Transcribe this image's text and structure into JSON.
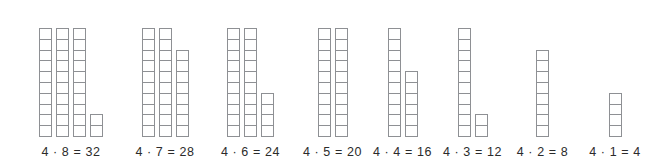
{
  "figure": {
    "units_per_full_column": 10,
    "grid_line_color": "#8e9094",
    "cell_fill_color": "#ffffff",
    "background_color": "#ffffff",
    "label_color": "#2b2b2b"
  },
  "chart_data": {
    "type": "bar",
    "xlabel": "",
    "ylabel": "",
    "grid": false,
    "legend": null,
    "categories": [
      "4 · 8 = 32",
      "4 · 7 = 28",
      "4 · 6 = 24",
      "4 · 5 = 20",
      "4 · 4 = 16",
      "4 · 3 = 12",
      "4 · 2 = 8",
      "4 · 1 = 4"
    ],
    "values": [
      32,
      28,
      24,
      20,
      16,
      12,
      8,
      4
    ],
    "ylim": [
      0,
      10
    ],
    "note": "Each total is drawn as columns of at most 10 unit squares; column_counts lists the squares in each column of a group."
  },
  "groups": [
    {
      "label": "4 · 8 = 32",
      "multiplicand": 4,
      "multiplier": 8,
      "product": 32,
      "column_counts": [
        10,
        10,
        10,
        2
      ]
    },
    {
      "label": "4 · 7 = 28",
      "multiplicand": 4,
      "multiplier": 7,
      "product": 28,
      "column_counts": [
        10,
        10,
        8
      ]
    },
    {
      "label": "4 · 6 = 24",
      "multiplicand": 4,
      "multiplier": 6,
      "product": 24,
      "column_counts": [
        10,
        10,
        4
      ]
    },
    {
      "label": "4 · 5 = 20",
      "multiplicand": 4,
      "multiplier": 5,
      "product": 20,
      "column_counts": [
        10,
        10
      ]
    },
    {
      "label": "4 · 4 = 16",
      "multiplicand": 4,
      "multiplier": 4,
      "product": 16,
      "column_counts": [
        10,
        6
      ]
    },
    {
      "label": "4 · 3 = 12",
      "multiplicand": 4,
      "multiplier": 3,
      "product": 12,
      "column_counts": [
        10,
        2
      ]
    },
    {
      "label": "4 · 2 = 8",
      "multiplicand": 4,
      "multiplier": 2,
      "product": 8,
      "column_counts": [
        8
      ]
    },
    {
      "label": "4 · 1 = 4",
      "multiplicand": 4,
      "multiplier": 1,
      "product": 4,
      "column_counts": [
        4
      ]
    }
  ],
  "layout": {
    "group_left_px": [
      26,
      125,
      208,
      300,
      370,
      440,
      510,
      580
    ],
    "group_width_px": [
      90,
      80,
      85,
      65,
      65,
      65,
      65,
      70
    ]
  }
}
